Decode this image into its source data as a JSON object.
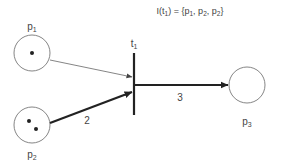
{
  "formula": {
    "lhs": "I(t",
    "lhs_sub": "1",
    "rhs_open": ") = {",
    "items": [
      {
        "base": "p",
        "sub": "1"
      },
      {
        "base": "p",
        "sub": "2"
      },
      {
        "base": "p",
        "sub": "2"
      }
    ],
    "sep": ", ",
    "close": "}"
  },
  "places": [
    {
      "id": "p1",
      "base": "p",
      "sub": "1",
      "tokens": 1
    },
    {
      "id": "p2",
      "base": "p",
      "sub": "2",
      "tokens": 2
    },
    {
      "id": "p3",
      "base": "p",
      "sub": "3",
      "tokens": 0
    }
  ],
  "transitions": [
    {
      "id": "t1",
      "base": "t",
      "sub": "1"
    }
  ],
  "arcs": [
    {
      "from": "p1",
      "to": "t1",
      "weight": ""
    },
    {
      "from": "p2",
      "to": "t1",
      "weight": "2"
    },
    {
      "from": "t1",
      "to": "p3",
      "weight": "3"
    }
  ],
  "colors": {
    "stroke": "#333333",
    "thin_arc": "#666666"
  }
}
